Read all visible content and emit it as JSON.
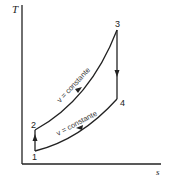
{
  "diagram": {
    "type": "T-s diagram (Otto cycle)",
    "axes": {
      "y_label": "T",
      "x_label": "s"
    },
    "points": [
      {
        "id": "1",
        "label": "1"
      },
      {
        "id": "2",
        "label": "2"
      },
      {
        "id": "3",
        "label": "3"
      },
      {
        "id": "4",
        "label": "4"
      }
    ],
    "processes": [
      {
        "from": "1",
        "to": "2",
        "label": ""
      },
      {
        "from": "2",
        "to": "3",
        "label": "v = constante"
      },
      {
        "from": "3",
        "to": "4",
        "label": ""
      },
      {
        "from": "4",
        "to": "1",
        "label": "v = constante"
      }
    ],
    "colors": {
      "line": "#222222",
      "background": "#ffffff"
    }
  }
}
